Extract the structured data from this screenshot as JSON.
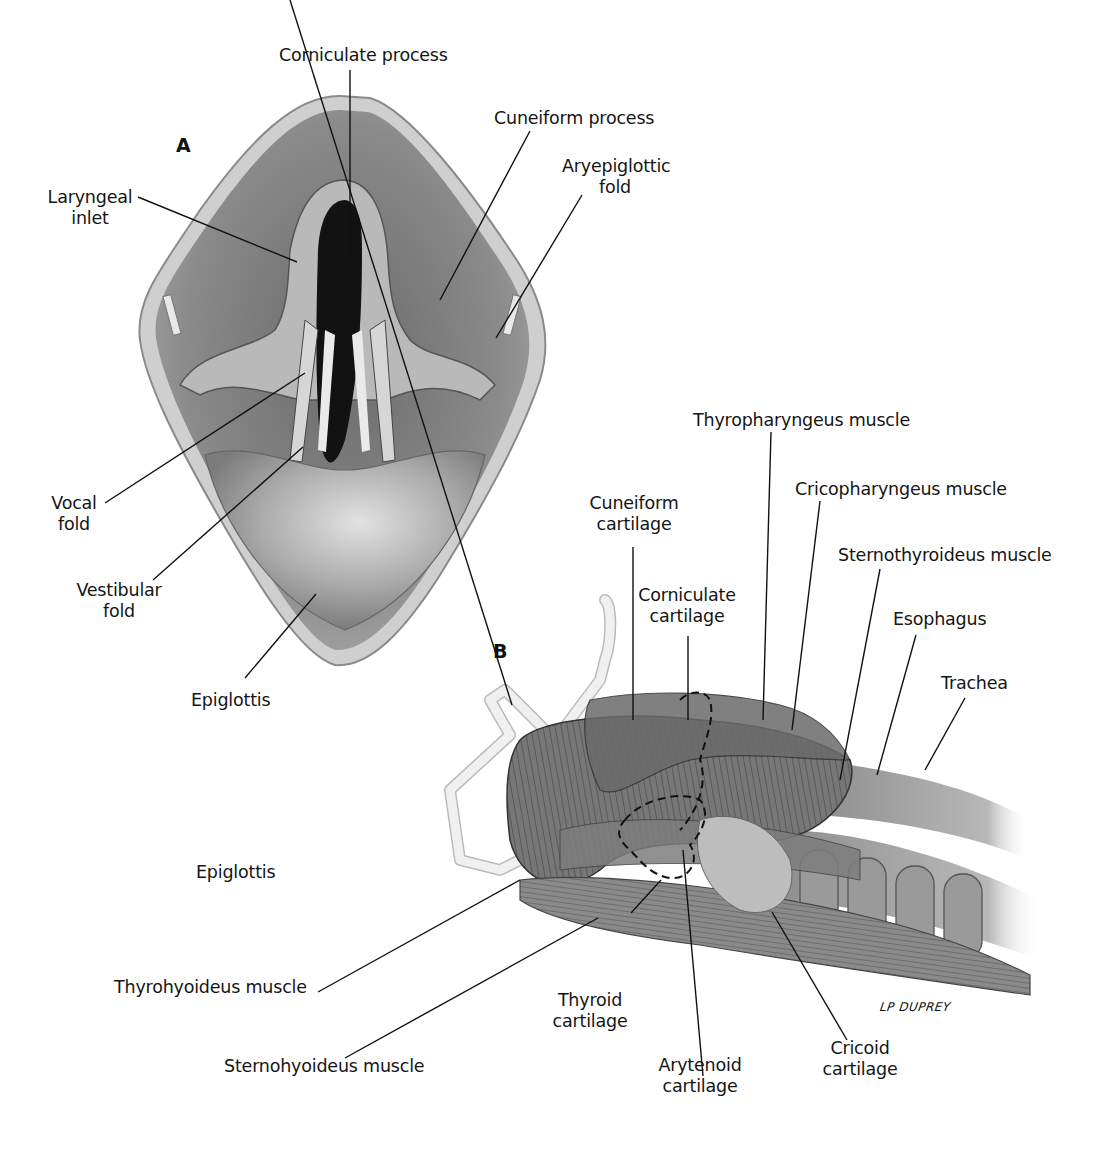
{
  "figure": {
    "panels": [
      {
        "id": "A",
        "letter": "A",
        "view": "superior view of laryngeal inlet",
        "labels": {
          "corniculate_process": "Corniculate process",
          "cuneiform_process": "Cuneiform process",
          "laryngeal_inlet_1": "Laryngeal",
          "laryngeal_inlet_2": "inlet",
          "aryepiglottic_fold_1": "Aryepiglottic",
          "aryepiglottic_fold_2": "fold",
          "vocal_fold_1": "Vocal",
          "vocal_fold_2": "fold",
          "vestibular_fold_1": "Vestibular",
          "vestibular_fold_2": "fold",
          "epiglottis": "Epiglottis"
        }
      },
      {
        "id": "B",
        "letter": "B",
        "view": "lateral view of larynx and associated muscles",
        "labels": {
          "thyropharyngeus": "Thyropharyngeus muscle",
          "cricopharyngeus": "Cricopharyngeus muscle",
          "cuneiform_cartilage_1": "Cuneiform",
          "cuneiform_cartilage_2": "cartilage",
          "sternothyroideus": "Sternothyroideus muscle",
          "corniculate_cartilage_1": "Corniculate",
          "corniculate_cartilage_2": "cartilage",
          "esophagus": "Esophagus",
          "trachea": "Trachea",
          "epiglottis": "Epiglottis",
          "thyrohyoideus": "Thyrohyoideus muscle",
          "sternohyoideus": "Sternohyoideus muscle",
          "thyroid_cartilage_1": "Thyroid",
          "thyroid_cartilage_2": "cartilage",
          "arytenoid_cartilage_1": "Arytenoid",
          "arytenoid_cartilage_2": "cartilage",
          "cricoid_cartilage_1": "Cricoid",
          "cricoid_cartilage_2": "cartilage"
        }
      }
    ],
    "signature": "LP DUPREY"
  }
}
